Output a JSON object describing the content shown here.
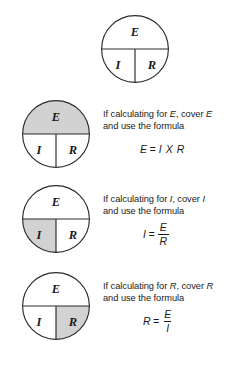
{
  "diagram": {
    "colors": {
      "background": "#ffffff",
      "stroke": "#2b2b2b",
      "shade": "#d2d2d2",
      "text": "#1a1a1a"
    },
    "quadrant_labels": {
      "top": "E",
      "bottom_left": "I",
      "bottom_right": "R"
    },
    "rows": [
      {
        "id": "legend",
        "shaded": "none",
        "caption_line1_prefix": "",
        "caption_line1_var1": "",
        "caption_line1_mid": "",
        "caption_line1_var2": "",
        "caption_line2": "",
        "formula": null
      },
      {
        "id": "solve-for-e",
        "shaded": "top",
        "caption_line1_prefix": "If calculating for ",
        "caption_line1_var1": "E",
        "caption_line1_mid": ", cover ",
        "caption_line1_var2": "E",
        "caption_line2": "and use the formula",
        "formula": {
          "kind": "inline",
          "lhs": "E",
          "eq": "=",
          "rhs": "I X R"
        }
      },
      {
        "id": "solve-for-i",
        "shaded": "bottom-left",
        "caption_line1_prefix": "If calculating for ",
        "caption_line1_var1": "I",
        "caption_line1_mid": ", cover ",
        "caption_line1_var2": "I",
        "caption_line2": "and use the formula",
        "formula": {
          "kind": "fraction",
          "lhs": "I",
          "eq": "=",
          "numerator": "E",
          "denominator": "R"
        }
      },
      {
        "id": "solve-for-r",
        "shaded": "bottom-right",
        "caption_line1_prefix": "If calculating for ",
        "caption_line1_var1": "R",
        "caption_line1_mid": ", cover ",
        "caption_line1_var2": "R",
        "caption_line2": "and use the formula",
        "formula": {
          "kind": "fraction",
          "lhs": "R",
          "eq": "=",
          "numerator": "E",
          "denominator": "I"
        }
      }
    ]
  }
}
